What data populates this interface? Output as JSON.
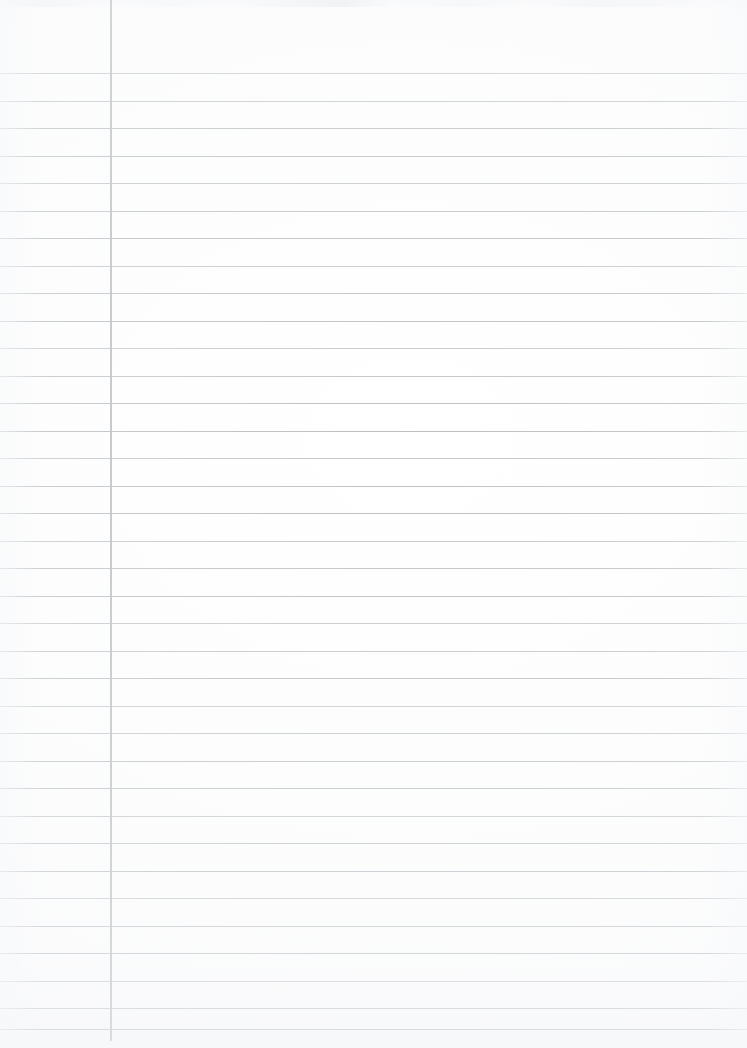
{
  "document": {
    "type": "scanned-ruled-paper",
    "title": "Blank ruled notebook page",
    "content_text": "",
    "page_width": 747,
    "page_height": 1048,
    "paper_color": "#ffffff",
    "rule_color": "#b9bdc2",
    "margin_rule_color": "#b5b9be",
    "is_blank": "true",
    "handwriting_present": "false"
  },
  "ruling": {
    "style": "wide-ruled-horizontal-with-left-margin",
    "line_count": 36,
    "first_line_y": 73,
    "line_spacing": 27.5,
    "line_thickness": 1,
    "lines_y": [
      73,
      100.5,
      128,
      155.5,
      183,
      210.5,
      238,
      265.5,
      293,
      320.5,
      348,
      375.5,
      403,
      430.5,
      458,
      485.5,
      513,
      540.5,
      568,
      595.5,
      623,
      650.5,
      678,
      705.5,
      733,
      760.5,
      788,
      815.5,
      843,
      870.5,
      898,
      925.5,
      953,
      980.5,
      1008,
      1029
    ]
  },
  "margin": {
    "name": "left-margin-rule",
    "x": 110,
    "top": 0,
    "bottom": 1041,
    "width": 2,
    "left_column_width": 110
  },
  "regions": {
    "header_area_label": "unruled header area",
    "left_margin_label": "left margin column",
    "writing_area_label": "main writing area",
    "footer_area_label": "unruled footer area"
  }
}
